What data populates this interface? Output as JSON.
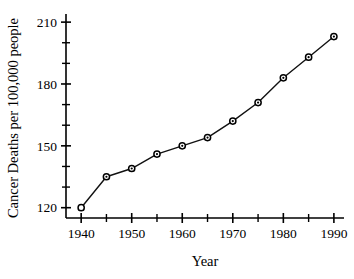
{
  "chart_data": {
    "type": "line",
    "title": "",
    "xlabel": "Year",
    "ylabel": "Cancer Deaths per 100,000 people",
    "x": [
      1940,
      1945,
      1950,
      1955,
      1960,
      1965,
      1970,
      1975,
      1980,
      1985,
      1990
    ],
    "values": [
      120,
      135,
      139,
      146,
      150,
      154,
      162,
      171,
      183,
      193,
      203
    ],
    "xlim": [
      1937,
      1992
    ],
    "ylim": [
      115,
      212
    ],
    "x_major_ticks": [
      1940,
      1950,
      1960,
      1970,
      1980,
      1990
    ],
    "x_minor_ticks": [
      1945,
      1955,
      1965,
      1975,
      1985
    ],
    "x_tick_labels": [
      "1940",
      "1950",
      "1960",
      "1970",
      "1980",
      "1990"
    ],
    "y_major_ticks": [
      120,
      150,
      180,
      210
    ],
    "y_minor_ticks": [
      130,
      140,
      160,
      170,
      190,
      200
    ],
    "y_tick_labels": [
      "120",
      "150",
      "180",
      "210"
    ],
    "grid": false,
    "legend": null,
    "marker": "open-circle",
    "line_color": "#111111",
    "marker_fill": "#ffffff",
    "marker_edge": "#000000"
  }
}
